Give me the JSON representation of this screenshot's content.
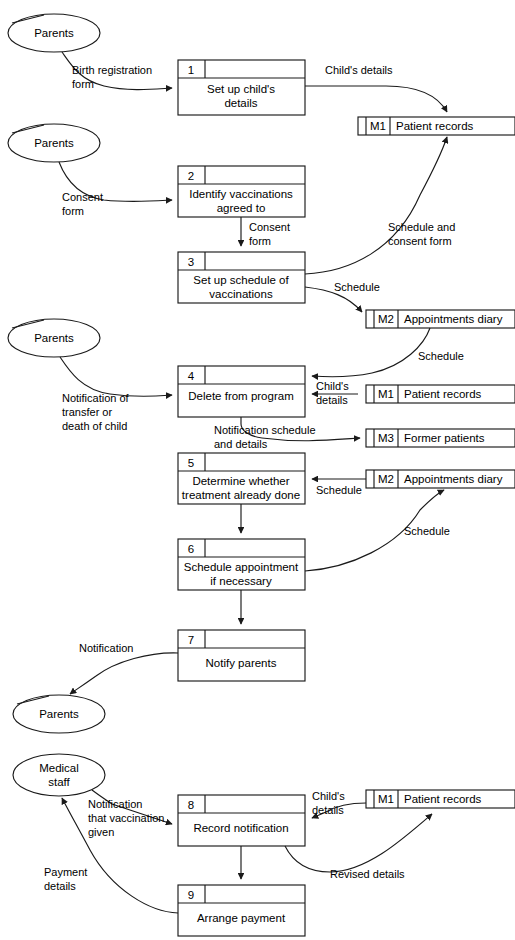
{
  "diagram": {
    "type": "data-flow-diagram",
    "stroke_color": "#1a1a1a",
    "background_color": "#ffffff"
  },
  "entities": [
    {
      "id": "e1",
      "label": "Parents",
      "label2": ""
    },
    {
      "id": "e2",
      "label": "Parents",
      "label2": ""
    },
    {
      "id": "e3",
      "label": "Parents",
      "label2": ""
    },
    {
      "id": "e4",
      "label": "Parents",
      "label2": ""
    },
    {
      "id": "e5",
      "label": "Medical",
      "label2": "staff"
    }
  ],
  "processes": [
    {
      "num": "1",
      "name_line1": "Set up child's",
      "name_line2": "details"
    },
    {
      "num": "2",
      "name_line1": "Identify vaccinations",
      "name_line2": "agreed to"
    },
    {
      "num": "3",
      "name_line1": "Set up schedule of",
      "name_line2": "vaccinations"
    },
    {
      "num": "4",
      "name_line1": "Delete from program",
      "name_line2": ""
    },
    {
      "num": "5",
      "name_line1": "Determine whether",
      "name_line2": "treatment already done"
    },
    {
      "num": "6",
      "name_line1": "Schedule appointment",
      "name_line2": "if necessary"
    },
    {
      "num": "7",
      "name_line1": "Notify parents",
      "name_line2": ""
    },
    {
      "num": "8",
      "name_line1": "Record notification",
      "name_line2": ""
    },
    {
      "num": "9",
      "name_line1": "Arrange payment",
      "name_line2": ""
    }
  ],
  "datastores": [
    {
      "id": "M1",
      "name": "Patient records"
    },
    {
      "id": "M2",
      "name": "Appointments diary"
    },
    {
      "id": "M1b",
      "code": "M1",
      "name": "Patient records"
    },
    {
      "id": "M3",
      "name": "Former patients"
    },
    {
      "id": "M2b",
      "code": "M2",
      "name": "Appointments diary"
    },
    {
      "id": "M1c",
      "code": "M1",
      "name": "Patient records"
    }
  ],
  "flows": [
    {
      "id": "f1",
      "line1": "Birth registration",
      "line2": "form"
    },
    {
      "id": "f2",
      "line1": "Child's details",
      "line2": ""
    },
    {
      "id": "f3",
      "line1": "Consent",
      "line2": "form"
    },
    {
      "id": "f4",
      "line1": "Consent",
      "line2": "form"
    },
    {
      "id": "f5",
      "line1": "Schedule and",
      "line2": "consent form"
    },
    {
      "id": "f6",
      "line1": "Schedule",
      "line2": ""
    },
    {
      "id": "f7",
      "line1": "Schedule",
      "line2": ""
    },
    {
      "id": "f8",
      "line1": "Child's",
      "line2": "details"
    },
    {
      "id": "f9",
      "line1": "Notification of",
      "line2": "transfer or",
      "line3": "death of child"
    },
    {
      "id": "f10",
      "line1": "Notification schedule",
      "line2": "and details"
    },
    {
      "id": "f11",
      "line1": "Schedule",
      "line2": ""
    },
    {
      "id": "f12",
      "line1": "Schedule",
      "line2": ""
    },
    {
      "id": "f13",
      "line1": "Notification",
      "line2": ""
    },
    {
      "id": "f14",
      "line1": "Notification",
      "line2": "that vaccination",
      "line3": "given"
    },
    {
      "id": "f15",
      "line1": "Child's",
      "line2": "details"
    },
    {
      "id": "f16",
      "line1": "Revised details",
      "line2": ""
    },
    {
      "id": "f17",
      "line1": "Payment",
      "line2": "details"
    }
  ]
}
